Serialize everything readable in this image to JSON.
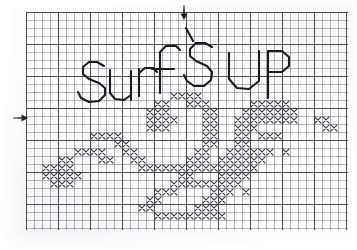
{
  "document": {
    "kind": "hand-drawn cross-stitch chart on graph paper",
    "title_text": "SURF'S UP",
    "title_words": [
      "SURF'S",
      "UP"
    ],
    "caption": "Cross-stitch chart: SURF'S UP with wave motif",
    "ink_color": "#1b1b1f",
    "stitch_color": "#3a3a40",
    "grid_line_color": "#7a7a80",
    "heavy_grid_line_color": "#3c3c41",
    "paper_color": "#ffffff"
  },
  "grid": {
    "origin_x": 26,
    "origin_y": 12,
    "cell_size": 8,
    "columns": 40,
    "rows": 27,
    "heavy_every": 4,
    "width": 322,
    "height": 218
  },
  "markers": [
    {
      "name": "top-center-marker",
      "direction": "down",
      "x": 183,
      "y": 6,
      "label": "vertical center mark"
    },
    {
      "name": "left-center-marker",
      "direction": "right",
      "x": 14,
      "y": 117,
      "label": "horizontal center mark"
    }
  ],
  "lettering": {
    "stroke_width": 2.1,
    "color": "#1b1b1f",
    "glyphs": [
      {
        "char": "S",
        "path": "M104,66 L97,62 L89,62 L83,67 L83,74 L89,79 L99,83 L105,88 L105,95 L99,101 L89,102 L81,98 L78,92"
      },
      {
        "char": "u",
        "path": "M110,70 L110,93 L115,99 L124,100 L131,95 L131,71 M131,71 L131,100"
      },
      {
        "char": "r",
        "path": "M139,96 L139,69 M139,73 L145,68 L153,68 L157,72"
      },
      {
        "char": "f",
        "path": "M160,93 L160,52 L166,46 L176,46 L180,50 M152,69 L174,69"
      },
      {
        "char": "apostrophe",
        "path": "M186,28 L193,41"
      },
      {
        "char": "S2",
        "path": "M212,47 L205,43 L196,43 L190,49 L190,56 L196,61 L207,66 L212,72 L211,80 L204,86 L194,86 L187,81 L184,75"
      },
      {
        "char": "U",
        "path": "M229,53 L229,79 L237,88 L249,89 L259,81 L259,51"
      },
      {
        "char": "P",
        "path": "M268,98 L268,51 M268,51 L282,51 L289,57 L289,66 L282,72 L268,72"
      }
    ]
  },
  "stitch_pattern": {
    "symbol": "X",
    "legend": "each X = one cross stitch",
    "cells": [
      [
        18,
        10
      ],
      [
        19,
        10
      ],
      [
        20,
        10
      ],
      [
        21,
        10
      ],
      [
        16,
        11
      ],
      [
        17,
        11
      ],
      [
        20,
        11
      ],
      [
        21,
        11
      ],
      [
        22,
        11
      ],
      [
        15,
        12
      ],
      [
        16,
        12
      ],
      [
        17,
        12
      ],
      [
        22,
        12
      ],
      [
        23,
        12
      ],
      [
        28,
        11
      ],
      [
        29,
        11
      ],
      [
        30,
        11
      ],
      [
        31,
        11
      ],
      [
        32,
        11
      ],
      [
        27,
        12
      ],
      [
        28,
        12
      ],
      [
        29,
        12
      ],
      [
        30,
        12
      ],
      [
        31,
        12
      ],
      [
        32,
        12
      ],
      [
        33,
        12
      ],
      [
        15,
        13
      ],
      [
        16,
        13
      ],
      [
        17,
        13
      ],
      [
        18,
        13
      ],
      [
        22,
        13
      ],
      [
        23,
        13
      ],
      [
        26,
        13
      ],
      [
        27,
        13
      ],
      [
        28,
        13
      ],
      [
        29,
        13
      ],
      [
        30,
        13
      ],
      [
        31,
        13
      ],
      [
        32,
        13
      ],
      [
        33,
        13
      ],
      [
        36,
        13
      ],
      [
        37,
        13
      ],
      [
        15,
        14
      ],
      [
        16,
        14
      ],
      [
        17,
        14
      ],
      [
        22,
        14
      ],
      [
        23,
        14
      ],
      [
        26,
        14
      ],
      [
        27,
        14
      ],
      [
        28,
        14
      ],
      [
        37,
        14
      ],
      [
        38,
        14
      ],
      [
        8,
        15
      ],
      [
        9,
        15
      ],
      [
        10,
        15
      ],
      [
        11,
        15
      ],
      [
        22,
        15
      ],
      [
        23,
        15
      ],
      [
        26,
        15
      ],
      [
        27,
        15
      ],
      [
        29,
        15
      ],
      [
        30,
        15
      ],
      [
        31,
        15
      ],
      [
        11,
        16
      ],
      [
        12,
        16
      ],
      [
        22,
        16
      ],
      [
        23,
        16
      ],
      [
        26,
        16
      ],
      [
        27,
        16
      ],
      [
        6,
        17
      ],
      [
        7,
        17
      ],
      [
        8,
        17
      ],
      [
        9,
        17
      ],
      [
        12,
        17
      ],
      [
        13,
        17
      ],
      [
        21,
        17
      ],
      [
        22,
        17
      ],
      [
        25,
        17
      ],
      [
        26,
        17
      ],
      [
        27,
        17
      ],
      [
        28,
        17
      ],
      [
        29,
        17
      ],
      [
        30,
        17
      ],
      [
        32,
        17
      ],
      [
        4,
        18
      ],
      [
        5,
        18
      ],
      [
        9,
        18
      ],
      [
        10,
        18
      ],
      [
        13,
        18
      ],
      [
        14,
        18
      ],
      [
        20,
        18
      ],
      [
        21,
        18
      ],
      [
        22,
        18
      ],
      [
        24,
        18
      ],
      [
        25,
        18
      ],
      [
        26,
        18
      ],
      [
        27,
        18
      ],
      [
        28,
        18
      ],
      [
        29,
        18
      ],
      [
        2,
        19
      ],
      [
        3,
        19
      ],
      [
        4,
        19
      ],
      [
        5,
        19
      ],
      [
        14,
        19
      ],
      [
        15,
        19
      ],
      [
        16,
        19
      ],
      [
        17,
        19
      ],
      [
        18,
        19
      ],
      [
        19,
        19
      ],
      [
        20,
        19
      ],
      [
        21,
        19
      ],
      [
        22,
        19
      ],
      [
        23,
        19
      ],
      [
        24,
        19
      ],
      [
        25,
        19
      ],
      [
        26,
        19
      ],
      [
        27,
        19
      ],
      [
        28,
        19
      ],
      [
        2,
        20
      ],
      [
        3,
        20
      ],
      [
        4,
        20
      ],
      [
        5,
        20
      ],
      [
        6,
        20
      ],
      [
        19,
        20
      ],
      [
        20,
        20
      ],
      [
        24,
        20
      ],
      [
        25,
        20
      ],
      [
        26,
        20
      ],
      [
        27,
        20
      ],
      [
        3,
        21
      ],
      [
        4,
        21
      ],
      [
        5,
        21
      ],
      [
        18,
        21
      ],
      [
        19,
        21
      ],
      [
        20,
        21
      ],
      [
        21,
        21
      ],
      [
        22,
        21
      ],
      [
        23,
        21
      ],
      [
        24,
        21
      ],
      [
        25,
        21
      ],
      [
        26,
        21
      ],
      [
        17,
        22
      ],
      [
        18,
        22
      ],
      [
        23,
        22
      ],
      [
        24,
        22
      ],
      [
        25,
        22
      ],
      [
        16,
        22
      ],
      [
        27,
        22
      ],
      [
        15,
        23
      ],
      [
        16,
        23
      ],
      [
        22,
        23
      ],
      [
        23,
        23
      ],
      [
        24,
        23
      ],
      [
        14,
        24
      ],
      [
        15,
        24
      ],
      [
        21,
        24
      ],
      [
        22,
        24
      ],
      [
        23,
        24
      ],
      [
        16,
        25
      ],
      [
        17,
        25
      ],
      [
        18,
        25
      ],
      [
        19,
        25
      ],
      [
        20,
        25
      ],
      [
        21,
        25
      ],
      [
        22,
        25
      ],
      [
        23,
        25
      ],
      [
        24,
        25
      ]
    ]
  }
}
